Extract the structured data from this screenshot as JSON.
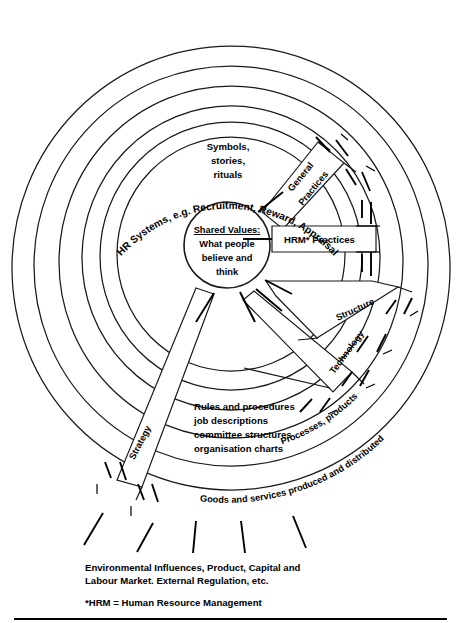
{
  "figure": {
    "core": {
      "heading": "Shared Values:",
      "line1": "What people",
      "line2": "believe and",
      "line3": "think"
    },
    "inner_labels": {
      "symbols_line1": "Symbols,",
      "symbols_line2": "stories,",
      "symbols_line3": "rituals",
      "hrm_practices": "HRM* Practices",
      "rules_line1": "Rules and procedures",
      "rules_line2": "job descriptions",
      "rules_line3": "committee structures",
      "rules_line4": "organisation charts"
    },
    "rings": [
      {
        "name": "hr-systems",
        "label": "HR Systems, e.g. Recruitment, Reward, Appraisal"
      },
      {
        "name": "processes-products",
        "label": "Processes, products"
      },
      {
        "name": "goods-services",
        "label": "Goods and services produced and distributed"
      }
    ],
    "spokes": [
      {
        "name": "general-practices",
        "line1": "General",
        "line2": "Practices"
      },
      {
        "name": "structure",
        "label": "Structure"
      },
      {
        "name": "technology",
        "label": "Technology"
      },
      {
        "name": "strategy",
        "label": "Strategy"
      }
    ],
    "captions": {
      "environment_line1": "Environmental Influences, Product, Capital and",
      "environment_line2": "Labour Market. External Regulation, etc.",
      "footnote": "*HRM = Human Resource Management"
    },
    "colors": {
      "ink": "#1a1a1a",
      "background": "#ffffff"
    }
  }
}
